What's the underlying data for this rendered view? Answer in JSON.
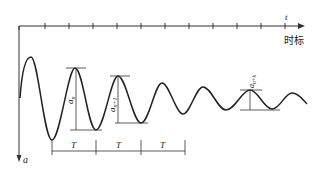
{
  "figure": {
    "type": "damped-oscillation-diagram",
    "time_axis": {
      "label": "t",
      "caption": "时标",
      "ticks": 12
    },
    "amplitude_axis": {
      "label": "a"
    },
    "amplitude_labels": {
      "first": "a",
      "first_sub": "n",
      "second": "a",
      "second_sub": "n+1",
      "third": "a",
      "third_sub": "n+k"
    },
    "period_labels": [
      "T",
      "T",
      "T"
    ],
    "colors": {
      "stroke": "#222222",
      "background": "#ffffff"
    }
  }
}
